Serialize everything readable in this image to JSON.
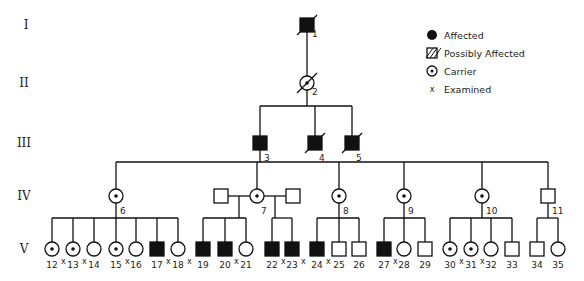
{
  "generations": [
    "I",
    "II",
    "III",
    "IV",
    "V"
  ],
  "legend": [
    {
      "symbol": "affected",
      "label": "Affected"
    },
    {
      "symbol": "possibly-affected",
      "label": "Possibly Affected"
    },
    {
      "symbol": "carrier",
      "label": "Carrier"
    },
    {
      "symbol": "examined",
      "label": "Examined"
    }
  ],
  "individuals": [
    {
      "id": "1",
      "gen": "I",
      "sex": "male",
      "status": "affected",
      "deceased": true,
      "examined": false
    },
    {
      "id": "2",
      "gen": "II",
      "sex": "female",
      "status": "carrier",
      "deceased": true,
      "examined": false
    },
    {
      "id": "3",
      "gen": "III",
      "sex": "male",
      "status": "affected",
      "deceased": false,
      "examined": false
    },
    {
      "id": "4",
      "gen": "III",
      "sex": "male",
      "status": "affected",
      "deceased": true,
      "examined": false
    },
    {
      "id": "5",
      "gen": "III",
      "sex": "male",
      "status": "affected",
      "deceased": true,
      "examined": false
    },
    {
      "id": "6",
      "gen": "IV",
      "sex": "female",
      "status": "carrier",
      "deceased": false,
      "examined": false
    },
    {
      "id": "7",
      "gen": "IV",
      "sex": "female",
      "status": "carrier",
      "deceased": false,
      "examined": false
    },
    {
      "id": "7a",
      "gen": "IV",
      "sex": "male",
      "status": "unaffected",
      "deceased": false,
      "examined": false,
      "label": ""
    },
    {
      "id": "7b",
      "gen": "IV",
      "sex": "male",
      "status": "unaffected",
      "deceased": false,
      "examined": false,
      "label": ""
    },
    {
      "id": "8",
      "gen": "IV",
      "sex": "female",
      "status": "carrier",
      "deceased": false,
      "examined": false
    },
    {
      "id": "9",
      "gen": "IV",
      "sex": "female",
      "status": "carrier",
      "deceased": false,
      "examined": false
    },
    {
      "id": "10",
      "gen": "IV",
      "sex": "female",
      "status": "carrier",
      "deceased": false,
      "examined": false
    },
    {
      "id": "11",
      "gen": "IV",
      "sex": "male",
      "status": "unaffected",
      "deceased": false,
      "examined": false
    },
    {
      "id": "12",
      "gen": "V",
      "sex": "female",
      "status": "carrier",
      "examined": true
    },
    {
      "id": "13",
      "gen": "V",
      "sex": "female",
      "status": "carrier",
      "examined": true
    },
    {
      "id": "14",
      "gen": "V",
      "sex": "female",
      "status": "unaffected",
      "examined": false
    },
    {
      "id": "15",
      "gen": "V",
      "sex": "female",
      "status": "carrier",
      "examined": true
    },
    {
      "id": "16",
      "gen": "V",
      "sex": "female",
      "status": "unaffected",
      "examined": false
    },
    {
      "id": "17",
      "gen": "V",
      "sex": "male",
      "status": "affected",
      "examined": true
    },
    {
      "id": "18",
      "gen": "V",
      "sex": "female",
      "status": "unaffected",
      "examined": true
    },
    {
      "id": "19",
      "gen": "V",
      "sex": "male",
      "status": "affected",
      "examined": false
    },
    {
      "id": "20",
      "gen": "V",
      "sex": "male",
      "status": "affected",
      "examined": true
    },
    {
      "id": "21",
      "gen": "V",
      "sex": "female",
      "status": "unaffected",
      "examined": false
    },
    {
      "id": "22",
      "gen": "V",
      "sex": "male",
      "status": "affected",
      "examined": true
    },
    {
      "id": "23",
      "gen": "V",
      "sex": "male",
      "status": "affected",
      "examined": true
    },
    {
      "id": "24",
      "gen": "V",
      "sex": "male",
      "status": "affected",
      "examined": true
    },
    {
      "id": "25",
      "gen": "V",
      "sex": "male",
      "status": "unaffected",
      "examined": false
    },
    {
      "id": "26",
      "gen": "V",
      "sex": "male",
      "status": "unaffected",
      "examined": false
    },
    {
      "id": "27",
      "gen": "V",
      "sex": "male",
      "status": "affected",
      "examined": true
    },
    {
      "id": "28",
      "gen": "V",
      "sex": "female",
      "status": "unaffected",
      "examined": false
    },
    {
      "id": "29",
      "gen": "V",
      "sex": "male",
      "status": "unaffected",
      "examined": false
    },
    {
      "id": "30",
      "gen": "V",
      "sex": "female",
      "status": "carrier",
      "examined": true
    },
    {
      "id": "31",
      "gen": "V",
      "sex": "female",
      "status": "carrier",
      "examined": true
    },
    {
      "id": "32",
      "gen": "V",
      "sex": "female",
      "status": "unaffected",
      "examined": false
    },
    {
      "id": "33",
      "gen": "V",
      "sex": "male",
      "status": "unaffected",
      "examined": false
    },
    {
      "id": "34",
      "gen": "V",
      "sex": "male",
      "status": "unaffected",
      "examined": false
    },
    {
      "id": "35",
      "gen": "V",
      "sex": "female",
      "status": "unaffected",
      "examined": false
    }
  ],
  "examined_marker": "x"
}
